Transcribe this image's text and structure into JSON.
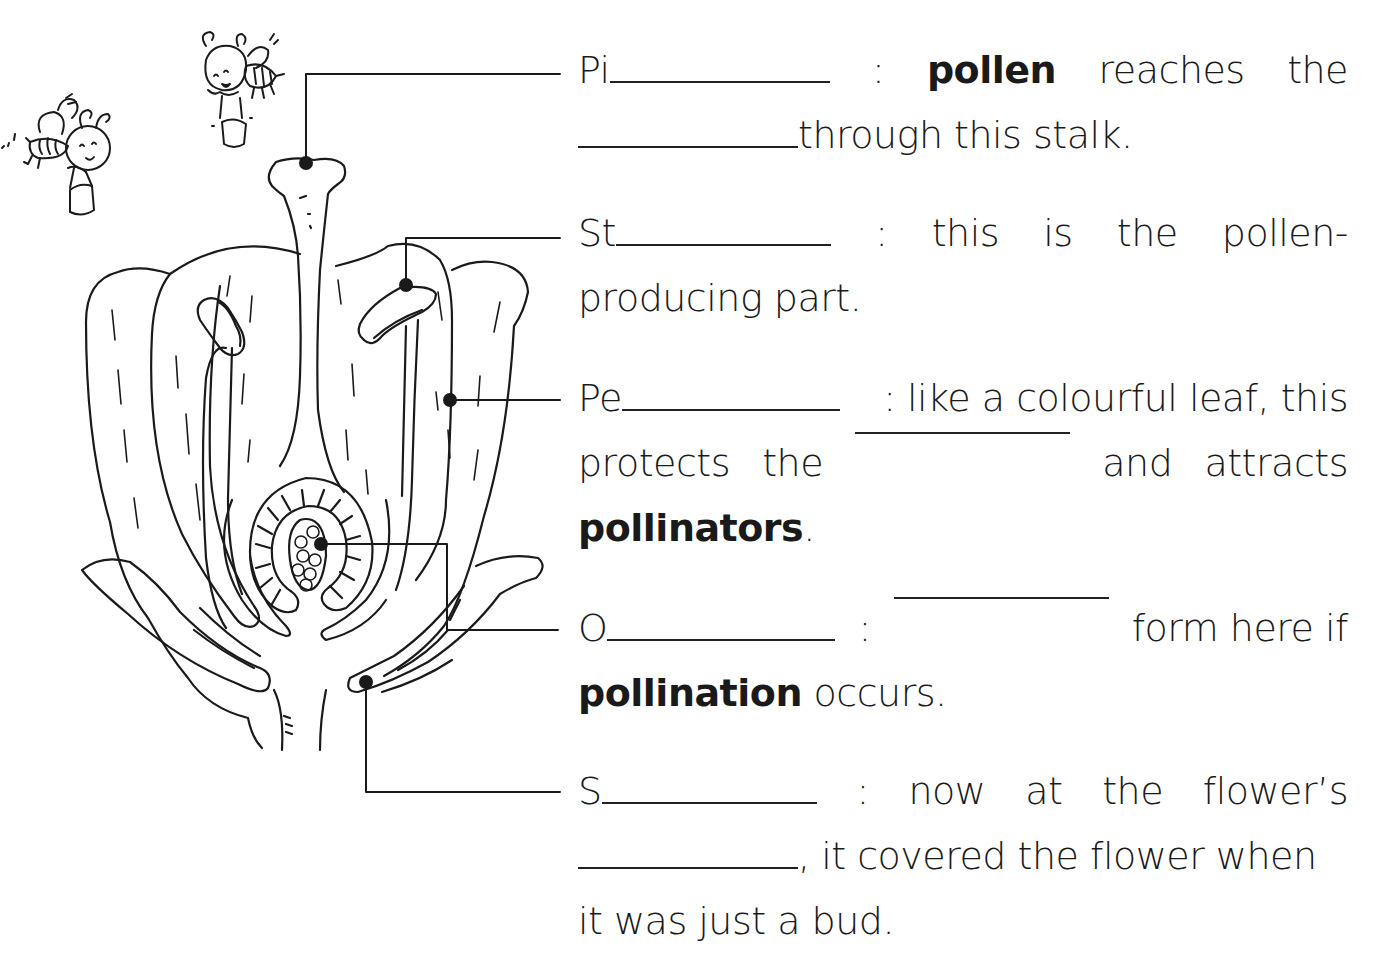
{
  "worksheet": {
    "topic": "Parts of a flower",
    "labels": [
      {
        "id": "pistil",
        "prefix": "Pi",
        "lines": [
          [
            "Pi",
            "_blank",
            ":",
            "**pollen**",
            "reaches",
            "the"
          ],
          [
            "_blank",
            "through this stalk."
          ]
        ]
      },
      {
        "id": "stamen",
        "prefix": "St",
        "lines": [
          [
            "St",
            "_blank",
            ":",
            "this",
            "is",
            "the",
            "pollen-"
          ],
          [
            "producing part."
          ]
        ]
      },
      {
        "id": "petal",
        "prefix": "Pe",
        "lines": [
          [
            "Pe",
            "_blank",
            ": like a colourful leaf, this"
          ],
          [
            "protects",
            "the",
            "_blank",
            "and",
            "attracts"
          ],
          [
            "**pollinators**",
            "."
          ]
        ]
      },
      {
        "id": "ovary",
        "prefix": "O",
        "lines": [
          [
            "O",
            "_blank",
            ":",
            "_blank",
            "form here if"
          ],
          [
            "**pollination**",
            " occurs."
          ]
        ]
      },
      {
        "id": "sepal",
        "prefix": "S",
        "lines": [
          [
            "S",
            "_blank",
            ":",
            "now",
            "at",
            "the",
            "flower’s"
          ],
          [
            "_blank",
            ", it covered the flower when"
          ],
          [
            "it was just a bud."
          ]
        ]
      }
    ],
    "text": {
      "pistil_1_prefix": "Pi",
      "pistil_1_colon": ":",
      "pistil_1_bold": "pollen",
      "pistil_1_w1": "reaches",
      "pistil_1_w2": "the",
      "pistil_2_rest": "through this stalk.",
      "stamen_1_prefix": "St",
      "stamen_1_colon": ":",
      "stamen_1_w1": "this",
      "stamen_1_w2": "is",
      "stamen_1_w3": "the",
      "stamen_1_w4": "pollen-",
      "stamen_2": "producing part.",
      "petal_1_prefix": "Pe",
      "petal_1_rest": ": like a colourful leaf, this",
      "petal_2_w1": "protects",
      "petal_2_w2": "the",
      "petal_2_w3": "and",
      "petal_2_w4": "attracts",
      "petal_3_bold": "pollinators",
      "petal_3_rest": ".",
      "ovary_1_prefix": "O",
      "ovary_1_colon": ":",
      "ovary_1_rest": "form here if",
      "ovary_2_bold": "pollination",
      "ovary_2_rest": " occurs.",
      "sepal_1_prefix": "S",
      "sepal_1_colon": ":",
      "sepal_1_w1": "now",
      "sepal_1_w2": "at",
      "sepal_1_w3": "the",
      "sepal_1_w4": "flower’s",
      "sepal_2_rest": ", it covered the flower when",
      "sepal_3": "it was just a bud."
    }
  },
  "diagram": {
    "pointers": [
      {
        "label": "pistil",
        "dot": [
          306,
          163
        ],
        "path": [
          [
            306,
            163
          ],
          [
            306,
            74
          ],
          [
            560,
            74
          ]
        ]
      },
      {
        "label": "stamen",
        "dot": [
          406,
          285
        ],
        "path": [
          [
            406,
            285
          ],
          [
            406,
            238
          ],
          [
            560,
            238
          ]
        ]
      },
      {
        "label": "petal",
        "dot": [
          450,
          400
        ],
        "path": [
          [
            450,
            400
          ],
          [
            560,
            400
          ]
        ]
      },
      {
        "label": "ovary",
        "dot": [
          321,
          544
        ],
        "path": [
          [
            321,
            544
          ],
          [
            447,
            544
          ],
          [
            447,
            630
          ],
          [
            558,
            630
          ]
        ]
      },
      {
        "label": "sepal",
        "dot": [
          366,
          682
        ],
        "path": [
          [
            366,
            682
          ],
          [
            366,
            792
          ],
          [
            560,
            792
          ]
        ]
      }
    ],
    "decorations": [
      "bee-with-bucket",
      "bee-with-bucket"
    ]
  },
  "colors": {
    "ink": "#1a1a1a",
    "background": "#ffffff"
  }
}
